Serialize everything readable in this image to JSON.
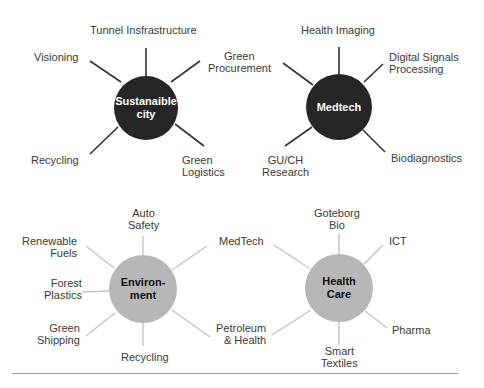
{
  "clusters": {
    "sustainable_city": {
      "title": "Sustanaible city",
      "title_line1": "Sustanaible",
      "title_line2": "city",
      "style": "dark",
      "spokes": [
        "Tunnel Insfrastructure",
        "Green Procurement",
        "Green Logistics",
        "Recycling",
        "Visioning"
      ],
      "labels": {
        "tunnel": "Tunnel Insfrastructure",
        "green_procurement_1": "Green",
        "green_procurement_2": "Procurement",
        "green_logistics_1": "Green",
        "green_logistics_2": "Logistics",
        "recycling": "Recycling",
        "visioning": "Visioning"
      }
    },
    "medtech": {
      "title": "Medtech",
      "style": "dark",
      "spokes": [
        "Health Imaging",
        "Digital Signals Processing",
        "Biodiagnostics",
        "GU/CH Research",
        "Green Procurement"
      ],
      "labels": {
        "health_imaging": "Health Imaging",
        "digital_signals_1": "Digital Signals",
        "digital_signals_2": "Processing",
        "biodiagnostics": "Biodiagnostics",
        "gu_ch_1": "GU/CH",
        "gu_ch_2": "Research"
      }
    },
    "environment": {
      "title": "Environment",
      "title_line1": "Environ-",
      "title_line2": "ment",
      "style": "light",
      "spokes": [
        "Auto Safety",
        "MedTech",
        "Petroleum & Health",
        "Recycling",
        "Green Shipping",
        "Forest Plastics",
        "Renewable Fuels"
      ],
      "labels": {
        "auto_1": "Auto",
        "auto_2": "Safety",
        "renewable_1": "Renewable",
        "renewable_2": "Fuels",
        "forest_1": "Forest",
        "forest_2": "Plastics",
        "shipping_1": "Green",
        "shipping_2": "Shipping",
        "recycling": "Recycling"
      }
    },
    "health_care": {
      "title": "Health Care",
      "title_line1": "Health",
      "title_line2": "Care",
      "style": "light",
      "spokes": [
        "Goteborg Bio",
        "ICT",
        "Pharma",
        "Smart Textiles",
        "Petroleum & Health",
        "MedTech"
      ],
      "labels": {
        "goteborg_1": "Goteborg",
        "goteborg_2": "Bio",
        "ict": "ICT",
        "pharma": "Pharma",
        "smart_1": "Smart",
        "smart_2": "Textiles",
        "medtech": "MedTech",
        "petroleum_1": "Petroleum",
        "petroleum_2": "& Health"
      }
    }
  },
  "colors": {
    "dark_hub": "#262626",
    "light_hub": "#b7b7b7",
    "dark_spoke": "#333333",
    "light_spoke": "#c4c4c4",
    "divider": "#9a9a9a"
  }
}
